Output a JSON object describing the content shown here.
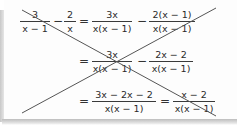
{
  "worked_example": {
    "status": "crossed-out",
    "rows": [
      {
        "terms": [
          {
            "num": "3",
            "den": "x − 1"
          },
          {
            "op": "−"
          },
          {
            "num": "2",
            "den": "x"
          },
          {
            "op": "="
          },
          {
            "num": "3x",
            "den": "x(x − 1)"
          },
          {
            "op": "−"
          },
          {
            "num": "2(x − 1)",
            "den": "x(x − 1)"
          }
        ]
      },
      {
        "terms": [
          {
            "op": "="
          },
          {
            "num": "3x",
            "den": "x(x − 1)"
          },
          {
            "op": "−"
          },
          {
            "num": "2x − 2",
            "den": "x(x − 1)"
          }
        ]
      },
      {
        "terms": [
          {
            "op": "="
          },
          {
            "num": "3x − 2x − 2",
            "den": "x(x − 1)"
          },
          {
            "op": "="
          },
          {
            "num": "x − 2",
            "den": "x(x − 1)"
          }
        ]
      }
    ],
    "strike_color": "#555555"
  }
}
